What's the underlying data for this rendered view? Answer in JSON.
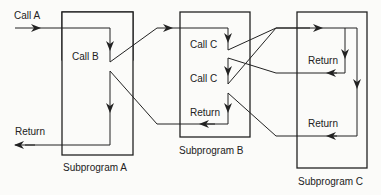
{
  "diagram": {
    "subprograms": [
      {
        "id": "A",
        "label": "Subprogram A"
      },
      {
        "id": "B",
        "label": "Subprogram B"
      },
      {
        "id": "C",
        "label": "Subprogram C"
      }
    ],
    "labels": {
      "call_a": "Call A",
      "call_b": "Call B",
      "return_a": "Return",
      "call_c_1": "Call C",
      "call_c_2": "Call C",
      "return_b": "Return",
      "return_c_1": "Return",
      "return_c_2": "Return"
    },
    "colors": {
      "line": "#222222",
      "background": "#fbfbf9"
    }
  }
}
